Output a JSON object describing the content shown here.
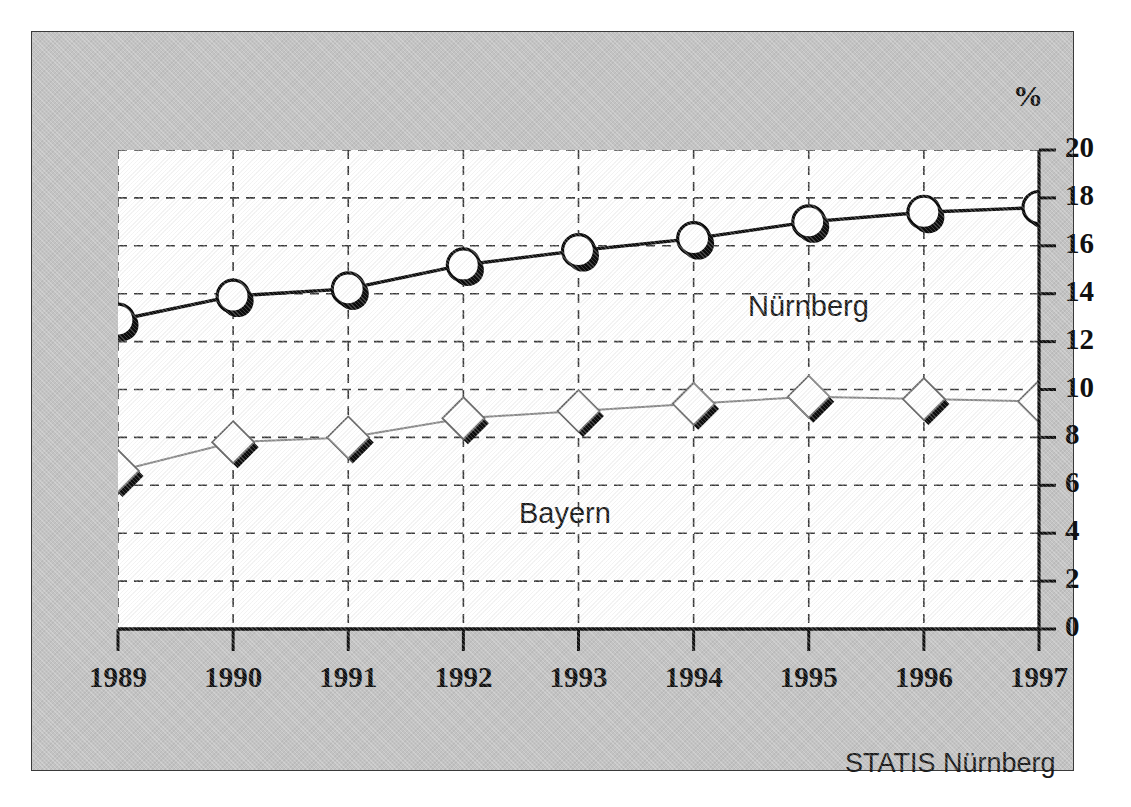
{
  "figure": {
    "percent_symbol": "%",
    "source_credit": "STATIS Nürnberg",
    "plate_color": "#c3c3c3",
    "plot_background": "#ffffff",
    "border_color": "#3a3a3a"
  },
  "chart_data": {
    "type": "line",
    "title": "",
    "subtitle": "",
    "xlabel": "",
    "ylabel": "%",
    "categories": [
      "1989",
      "1990",
      "1991",
      "1992",
      "1993",
      "1994",
      "1995",
      "1996",
      "1997"
    ],
    "x": [
      1989,
      1990,
      1991,
      1992,
      1993,
      1994,
      1995,
      1996,
      1997
    ],
    "ylim": [
      0,
      20
    ],
    "ytick_step": 2,
    "yticks": [
      "20",
      "18",
      "16",
      "14",
      "12",
      "10",
      "8",
      "6",
      "4",
      "2",
      "0"
    ],
    "ytick_values": [
      20,
      18,
      16,
      14,
      12,
      10,
      8,
      6,
      4,
      2,
      0
    ],
    "grid": true,
    "grid_style": "dashed",
    "legend": "inline-annotations",
    "series": [
      {
        "name": "Nürnberg",
        "marker": "circle",
        "color": "#111111",
        "line_color": "#111111",
        "values": [
          12.9,
          13.9,
          14.2,
          15.2,
          15.8,
          16.3,
          17.0,
          17.4,
          17.6
        ]
      },
      {
        "name": "Bayern",
        "marker": "diamond",
        "color": "#8c8c8c",
        "line_color": "#8c8c8c",
        "values": [
          6.6,
          7.8,
          8.0,
          8.8,
          9.1,
          9.4,
          9.7,
          9.6,
          9.5
        ]
      }
    ],
    "annotations": [
      {
        "text": "Nürnberg",
        "series": "Nürnberg"
      },
      {
        "text": "Bayern",
        "series": "Bayern"
      }
    ]
  }
}
